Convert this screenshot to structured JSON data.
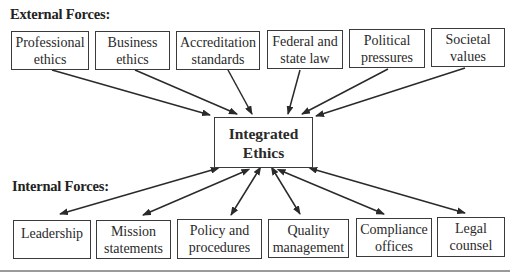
{
  "external": {
    "heading": "External Forces:",
    "items": [
      {
        "line1": "Professional",
        "line2": "ethics"
      },
      {
        "line1": "Business",
        "line2": "ethics"
      },
      {
        "line1": "Accreditation",
        "line2": "standards"
      },
      {
        "line1": "Federal and",
        "line2": "state law"
      },
      {
        "line1": "Political",
        "line2": "pressures"
      },
      {
        "line1": "Societal",
        "line2": "values"
      }
    ]
  },
  "center": {
    "line1": "Integrated",
    "line2": "Ethics"
  },
  "internal": {
    "heading": "Internal Forces:",
    "items": [
      {
        "line1": "Leadership",
        "line2": ""
      },
      {
        "line1": "Mission",
        "line2": "statements"
      },
      {
        "line1": "Policy and",
        "line2": "procedures"
      },
      {
        "line1": "Quality",
        "line2": "management"
      },
      {
        "line1": "Compliance",
        "line2": "offices"
      },
      {
        "line1": "Legal",
        "line2": "counsel"
      }
    ]
  },
  "connections": {
    "external_to_center": "one-way arrows pointing into Integrated Ethics",
    "internal_to_center": "two-way arrows between Integrated Ethics and each internal force"
  }
}
